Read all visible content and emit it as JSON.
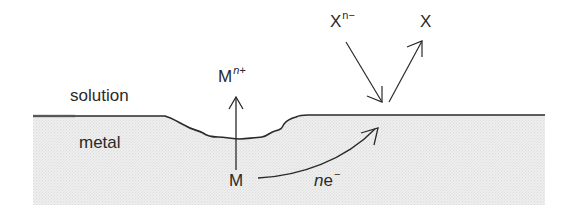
{
  "diagram": {
    "type": "corrosion-mechanism-schematic",
    "regions": {
      "solution": {
        "label": "solution"
      },
      "metal": {
        "label": "metal"
      }
    },
    "species": {
      "metal_atom": {
        "label": "M"
      },
      "metal_ion": {
        "base": "M",
        "superscript": "n+"
      },
      "oxidant": {
        "base": "X",
        "superscript": "n−"
      },
      "reduced": {
        "label": "X"
      },
      "electrons": {
        "coefficient": "n",
        "base": "e",
        "superscript": "−"
      }
    },
    "arrows": [
      {
        "from": "M",
        "to": "M^n+",
        "meaning": "metal dissolution (oxidation) out of the pit"
      },
      {
        "from": "M",
        "to": "surface",
        "label": "ne−",
        "meaning": "electrons flow through metal to cathodic site"
      },
      {
        "from": "X^n−",
        "to": "surface",
        "meaning": "species arrives at metal surface"
      },
      {
        "from": "surface",
        "to": "X",
        "meaning": "product leaves surface"
      }
    ],
    "colors": {
      "ink": "#2a2a2a",
      "metal_fill": "#ececec",
      "background": "#ffffff"
    }
  }
}
